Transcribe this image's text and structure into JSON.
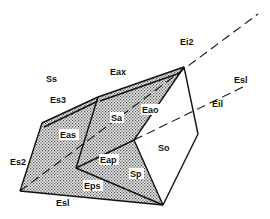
{
  "diagram": {
    "colors": {
      "line": "#111111",
      "shade": "#bdbdbd",
      "background": "#ffffff"
    },
    "faces": [
      {
        "id": "Ss",
        "label": "Ss"
      },
      {
        "id": "Sa",
        "label": "Sa"
      },
      {
        "id": "So",
        "label": "So"
      },
      {
        "id": "Sp",
        "label": "Sp"
      }
    ],
    "edges": [
      {
        "id": "Eax",
        "label": "Eax"
      },
      {
        "id": "Es3",
        "label": "Es3"
      },
      {
        "id": "Eas",
        "label": "Eas"
      },
      {
        "id": "Eao",
        "label": "Eao"
      },
      {
        "id": "Es2",
        "label": "Es2"
      },
      {
        "id": "Eap",
        "label": "Eap"
      },
      {
        "id": "Eps",
        "label": "Eps"
      },
      {
        "id": "Esl_bottom",
        "label": "Esl"
      },
      {
        "id": "Ei2",
        "label": "Ei2"
      },
      {
        "id": "Esl_right",
        "label": "Esl"
      },
      {
        "id": "Eil",
        "label": "Eil"
      }
    ]
  }
}
